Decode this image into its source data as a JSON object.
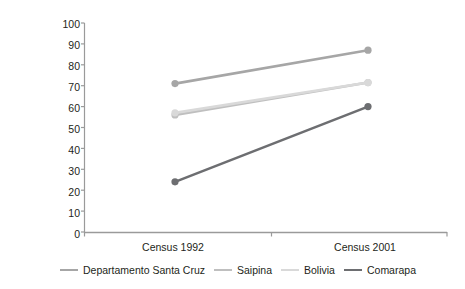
{
  "chart_data": {
    "type": "line",
    "title": "",
    "xlabel": "",
    "ylabel": "% of population with\naccess to potable water",
    "categories": [
      "Census 1992",
      "Census 2001"
    ],
    "x": [
      0,
      1
    ],
    "ylim": [
      0,
      100
    ],
    "yticks": [
      0,
      10,
      20,
      30,
      40,
      50,
      60,
      70,
      80,
      90,
      100
    ],
    "ytick_labels": [
      "0",
      "10",
      "20",
      "30",
      "40",
      "50",
      "60",
      "70",
      "80",
      "90",
      "100"
    ],
    "grid": false,
    "legend_position": "bottom",
    "markers": "circle",
    "series": [
      {
        "name": "Departamento Santa Cruz",
        "values": [
          71,
          87
        ],
        "color": "#a6a6a6"
      },
      {
        "name": "Saipina",
        "values": [
          56,
          71.5
        ],
        "color": "#bfbfbf"
      },
      {
        "name": "Bolivia",
        "values": [
          57,
          71.5
        ],
        "color": "#d9d9d9"
      },
      {
        "name": "Comarapa",
        "values": [
          24,
          60
        ],
        "color": "#6d6e71"
      }
    ]
  },
  "axis": {
    "y_axis_color": "#9a9a9a",
    "x_axis_color": "#9a9a9a"
  },
  "legend": {
    "items": [
      {
        "label": "Departamento Santa Cruz",
        "color": "#a6a6a6"
      },
      {
        "label": "Saipina",
        "color": "#bfbfbf"
      },
      {
        "label": "Bolivia",
        "color": "#d9d9d9"
      },
      {
        "label": "Comarapa",
        "color": "#6d6e71"
      }
    ]
  }
}
